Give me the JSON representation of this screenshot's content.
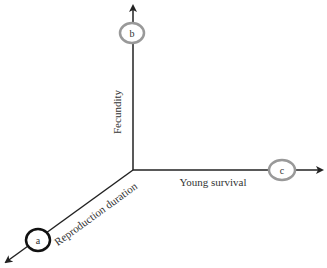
{
  "diagram": {
    "type": "3-axis trait space",
    "axes": [
      {
        "id": "fecundity",
        "label": "Fecundity",
        "direction": "up",
        "node": "b"
      },
      {
        "id": "young_survival",
        "label": "Young survival",
        "direction": "right",
        "node": "c"
      },
      {
        "id": "reproduction_duration",
        "label": "Reproduction duration",
        "direction": "down-left",
        "node": "a"
      }
    ],
    "nodes": [
      {
        "id": "a",
        "label": "a",
        "stroke": "#111111"
      },
      {
        "id": "b",
        "label": "b",
        "stroke": "#999999"
      },
      {
        "id": "c",
        "label": "c",
        "stroke": "#999999"
      }
    ],
    "colors": {
      "axis": "#222222",
      "text": "#333333"
    }
  }
}
